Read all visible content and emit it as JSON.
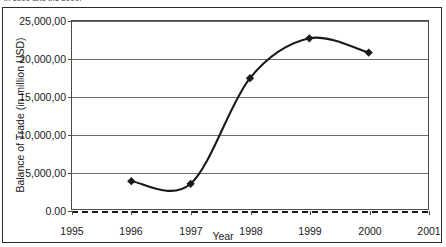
{
  "figure": {
    "cut_off_caption": "in 1999 and the 2000.",
    "x_axis_title": "Year",
    "y_axis_title": "Balance of Trade (in million USD)"
  },
  "axes": {
    "y_tick_labels": [
      "25,000,00",
      "20,000,00",
      "15,000,00",
      "10,000,00",
      "5,000,00",
      "0.00"
    ],
    "x_tick_labels": [
      "1995",
      "1996",
      "1997",
      "1998",
      "1999",
      "2000",
      "2001"
    ]
  },
  "colors": {
    "line": "#1a1a1a",
    "marker": "#1a1a1a",
    "gridline": "#6e6e6e",
    "zero_line": "#1a1a1a",
    "frame": "#2b2b2b",
    "background": "#ffffff"
  },
  "chart_data": {
    "type": "line",
    "title": "",
    "subtitle": "",
    "xlabel": "Year",
    "ylabel": "Balance of Trade (in million USD)",
    "x": [
      1996,
      1997,
      1998,
      1999,
      2000
    ],
    "categories": [
      "1996",
      "1997",
      "1998",
      "1999",
      "2000"
    ],
    "values": [
      3700,
      3350,
      17400,
      22700,
      20800
    ],
    "series": [
      {
        "name": "Balance of Trade",
        "values": [
          3700,
          3350,
          17400,
          22700,
          20800
        ],
        "marker": "diamond",
        "smoothed": true
      }
    ],
    "xlim": [
      1995,
      2001
    ],
    "ylim": [
      0,
      25000
    ],
    "ytick_values": [
      25000,
      20000,
      15000,
      10000,
      5000,
      0
    ],
    "ytick_labels_displayed": [
      "25,000,00",
      "20,000,00",
      "15,000,00",
      "10,000,00",
      "5,000,00",
      "0.00"
    ],
    "xtick_values": [
      1995,
      1996,
      1997,
      1998,
      1999,
      2000,
      2001
    ],
    "grid": true,
    "grid_axis": "y",
    "legend": false,
    "legend_position": "none",
    "zero_line": {
      "value": 0,
      "style": "dashed"
    },
    "annotations": []
  }
}
